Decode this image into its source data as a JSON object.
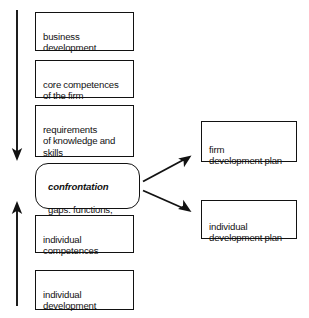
{
  "diagram": {
    "background": "#ffffff",
    "ink_color": "#121212",
    "left_column": [
      {
        "id": "business-development",
        "text": "business\ndevelopment",
        "x": 35,
        "y": 12,
        "w": 99,
        "h": 39,
        "shape": "rect"
      },
      {
        "id": "core-competences",
        "text": "core competences\nof the firm",
        "x": 35,
        "y": 60,
        "w": 99,
        "h": 38,
        "shape": "rect"
      },
      {
        "id": "requirements-knowledge-skills",
        "text": "requirements\nof knowledge and\nskills",
        "x": 35,
        "y": 105,
        "w": 99,
        "h": 52,
        "shape": "rect"
      },
      {
        "id": "confrontation",
        "lead": "confrontation",
        "text": "gaps: functions,\nskills, jobs",
        "x": 35,
        "y": 163,
        "w": 105,
        "h": 46,
        "shape": "rounded"
      },
      {
        "id": "individual-competences",
        "text": "individual\ncompetences",
        "x": 35,
        "y": 215,
        "w": 99,
        "h": 38,
        "shape": "rect"
      },
      {
        "id": "individual-development",
        "text": "individual\ndevelopment",
        "x": 35,
        "y": 270,
        "w": 99,
        "h": 40,
        "shape": "rect"
      }
    ],
    "right_column": [
      {
        "id": "firm-development-plan",
        "text": "firm\ndevelopment plan",
        "x": 201,
        "y": 121,
        "w": 96,
        "h": 41,
        "shape": "rect"
      },
      {
        "id": "individual-development-plan",
        "text": "individual\ndevelopment plan",
        "x": 201,
        "y": 200,
        "w": 96,
        "h": 39,
        "shape": "rect"
      }
    ],
    "arrows": [
      {
        "id": "downward-flow-arrow",
        "direction": "down",
        "x1": 17,
        "y1": 10,
        "x2": 17,
        "y2": 160
      },
      {
        "id": "upward-flow-arrow",
        "direction": "up",
        "x1": 17,
        "y1": 306,
        "x2": 17,
        "y2": 202
      },
      {
        "id": "arrow-to-firm-plan",
        "direction": "up-right",
        "x1": 143,
        "y1": 181,
        "x2": 191,
        "y2": 155
      },
      {
        "id": "arrow-to-individual-plan",
        "direction": "down-right",
        "x1": 143,
        "y1": 190,
        "x2": 191,
        "y2": 213
      }
    ]
  }
}
